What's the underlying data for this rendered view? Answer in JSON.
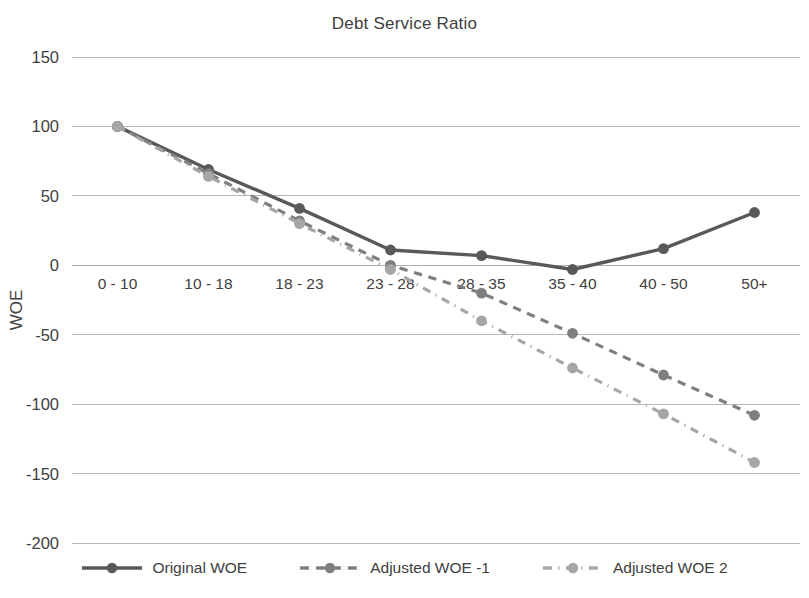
{
  "chart_data": {
    "type": "line",
    "title": "Debt Service Ratio",
    "xlabel": "",
    "ylabel": "WOE",
    "categories": [
      "0 - 10",
      "10 - 18",
      "18 - 23",
      "23 - 28",
      "28 - 35",
      "35 - 40",
      "40 - 50",
      "50+"
    ],
    "ylim": [
      -200,
      150
    ],
    "yticks": [
      150,
      100,
      50,
      0,
      -50,
      -100,
      -150,
      -200
    ],
    "ytick_labels": [
      "150",
      "100",
      "50",
      "0",
      "-50",
      "-100",
      "-150",
      "-200"
    ],
    "grid": true,
    "legend_position": "bottom",
    "series": [
      {
        "name": "Original WOE",
        "values": [
          100,
          69,
          41,
          11,
          7,
          -3,
          12,
          38
        ],
        "color": "#595959",
        "style": "solid",
        "marker": "circle"
      },
      {
        "name": "Adjusted WOE -1",
        "values": [
          100,
          66,
          32,
          0,
          -20,
          -49,
          -79,
          -108
        ],
        "color": "#7f7f7f",
        "style": "dashed",
        "marker": "circle"
      },
      {
        "name": "Adjusted WOE 2",
        "values": [
          100,
          64,
          30,
          -3,
          -40,
          -74,
          -107,
          -142
        ],
        "color": "#a6a6a6",
        "style": "dashdot",
        "marker": "circle"
      }
    ]
  },
  "legend": {
    "items": [
      {
        "label": "Original WOE"
      },
      {
        "label": "Adjusted WOE -1"
      },
      {
        "label": "Adjusted WOE 2"
      }
    ]
  }
}
